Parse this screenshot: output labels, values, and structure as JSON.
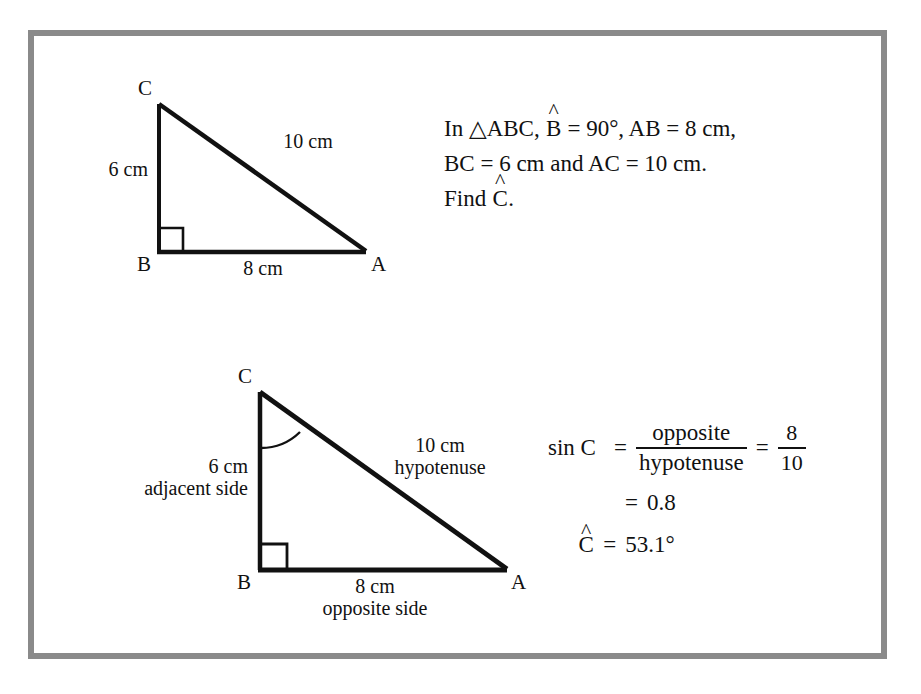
{
  "page": {
    "background": "#ffffff",
    "frame_color": "#8a8a8a",
    "ink_color": "#111111"
  },
  "statement": {
    "line1_pre": "In ",
    "triangle_symbol": "△",
    "line1_abc": "ABC, ",
    "line1_angle_letter": "B",
    "line1_post": " = 90°, AB = 8 cm,",
    "line2": "BC = 6 cm and AC = 10 cm.",
    "line3_pre": "Find ",
    "line3_angle_letter": "C",
    "line3_post": "."
  },
  "figure1": {
    "name": "right-triangle-abc-plain",
    "vertices": {
      "C": {
        "label": "C",
        "x": 158,
        "y": 104
      },
      "B": {
        "label": "B",
        "x": 159,
        "y": 252
      },
      "A": {
        "label": "A",
        "x": 365,
        "y": 252
      }
    },
    "labels": {
      "vertical_side": "6 cm",
      "hypotenuse": "10 cm",
      "base_side": "8 cm"
    },
    "right_angle_at": "B"
  },
  "figure2": {
    "name": "right-triangle-abc-annotated",
    "vertices": {
      "C": {
        "label": "C",
        "x": 258,
        "y": 392
      },
      "B": {
        "label": "B",
        "x": 260,
        "y": 570
      },
      "A": {
        "label": "A",
        "x": 505,
        "y": 570
      }
    },
    "labels": {
      "vertical_value": "6 cm",
      "vertical_role": "adjacent side",
      "hypotenuse_value": "10 cm",
      "hypotenuse_role": "hypotenuse",
      "base_value": "8 cm",
      "base_role": "opposite side"
    },
    "right_angle_at": "B",
    "marked_angle_at": "C"
  },
  "solution": {
    "row1": {
      "lhs": "sin C",
      "equals": "=",
      "fraction1_numerator": "opposite",
      "fraction1_denominator": "hypotenuse",
      "equals2": "=",
      "fraction2_numerator": "8",
      "fraction2_denominator": "10"
    },
    "row2": {
      "equals": "=",
      "value": "0.8"
    },
    "row3": {
      "angle_letter": "C",
      "equals": "=",
      "value": "53.1°"
    }
  }
}
